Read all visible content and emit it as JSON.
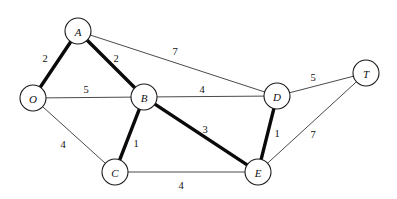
{
  "diagram": {
    "type": "weighted-undirected-graph",
    "width": 397,
    "height": 199,
    "background_color": "#ffffff",
    "node_fill_color": "#ffffff",
    "node_stroke_color": "#1a1a1a",
    "thin_edge_color": "#4a4a4a",
    "bold_edge_color": "#0a0a0a",
    "nodes": [
      {
        "id": "A",
        "label": "A",
        "x": 78,
        "y": 31,
        "r": 13
      },
      {
        "id": "O",
        "label": "O",
        "x": 33,
        "y": 98,
        "r": 13
      },
      {
        "id": "B",
        "label": "B",
        "x": 144,
        "y": 97,
        "r": 13
      },
      {
        "id": "D",
        "label": "D",
        "x": 277,
        "y": 96,
        "r": 13
      },
      {
        "id": "T",
        "label": "T",
        "x": 366,
        "y": 73,
        "r": 13
      },
      {
        "id": "C",
        "label": "C",
        "x": 115,
        "y": 172,
        "r": 13
      },
      {
        "id": "E",
        "label": "E",
        "x": 258,
        "y": 172,
        "r": 13
      }
    ],
    "edges": [
      {
        "id": "O-A",
        "from": "O",
        "to": "A",
        "weight": "2",
        "bold": true,
        "label_x": 45,
        "label_y": 58
      },
      {
        "id": "A-B",
        "from": "A",
        "to": "B",
        "weight": "2",
        "bold": true,
        "label_x": 116,
        "label_y": 58
      },
      {
        "id": "A-D",
        "from": "A",
        "to": "D",
        "weight": "7",
        "bold": false,
        "label_x": 175,
        "label_y": 51
      },
      {
        "id": "O-B",
        "from": "O",
        "to": "B",
        "weight": "5",
        "bold": false,
        "label_x": 86,
        "label_y": 89
      },
      {
        "id": "B-D",
        "from": "B",
        "to": "D",
        "weight": "4",
        "bold": false,
        "label_x": 202,
        "label_y": 89
      },
      {
        "id": "D-T",
        "from": "D",
        "to": "T",
        "weight": "5",
        "bold": false,
        "label_x": 313,
        "label_y": 77
      },
      {
        "id": "O-C",
        "from": "O",
        "to": "C",
        "weight": "4",
        "bold": false,
        "label_x": 63,
        "label_y": 144
      },
      {
        "id": "B-C",
        "from": "B",
        "to": "C",
        "weight": "1",
        "bold": true,
        "label_x": 136,
        "label_y": 143
      },
      {
        "id": "B-E",
        "from": "B",
        "to": "E",
        "weight": "3",
        "bold": true,
        "label_x": 205,
        "label_y": 129
      },
      {
        "id": "D-E",
        "from": "D",
        "to": "E",
        "weight": "1",
        "bold": true,
        "label_x": 277,
        "label_y": 133
      },
      {
        "id": "T-E",
        "from": "T",
        "to": "E",
        "weight": "7",
        "bold": false,
        "label_x": 313,
        "label_y": 134
      },
      {
        "id": "C-E",
        "from": "C",
        "to": "E",
        "weight": "4",
        "bold": false,
        "label_x": 181,
        "label_y": 185
      }
    ]
  }
}
